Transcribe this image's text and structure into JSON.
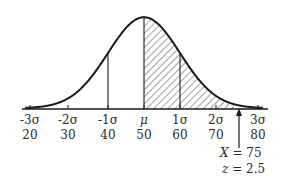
{
  "chart_data": {
    "type": "area",
    "title": "",
    "mean": 50,
    "sd": 10,
    "xlabel": "",
    "ylabel": "",
    "xlim": [
      17,
      83
    ],
    "grid": false,
    "legend": null,
    "sigma_ticks": [
      {
        "sigma_label": "-3σ",
        "value": "20",
        "x": 20
      },
      {
        "sigma_label": "-2σ",
        "value": "30",
        "x": 30
      },
      {
        "sigma_label": "-1σ",
        "value": "40",
        "x": 40
      },
      {
        "sigma_label": "μ",
        "value": "50",
        "x": 50
      },
      {
        "sigma_label": "1σ",
        "value": "60",
        "x": 60
      },
      {
        "sigma_label": "2σ",
        "value": "70",
        "x": 70
      },
      {
        "sigma_label": "3σ",
        "value": "80",
        "x": 80
      }
    ],
    "vertical_lines_at": [
      40,
      50,
      60
    ],
    "shaded_region": {
      "from": 50,
      "to": 75,
      "pattern": "diagonal-hatch"
    },
    "annotation": {
      "x_label": "X",
      "x_value": "75",
      "z_label": "z",
      "z_value": "2.5",
      "arrow_at": 75
    }
  },
  "labels": {
    "ticks": [
      {
        "sigma": "-3σ",
        "val": "20"
      },
      {
        "sigma": "-2σ",
        "val": "30"
      },
      {
        "sigma": "-1σ",
        "val": "40"
      },
      {
        "sigma": "μ",
        "val": "50"
      },
      {
        "sigma": "1σ",
        "val": "60"
      },
      {
        "sigma": "2σ",
        "val": "70"
      },
      {
        "sigma": "3σ",
        "val": "80"
      }
    ],
    "x_text": "X",
    "x_eq": "= 75",
    "z_text": "z",
    "z_eq": "= 2.5"
  }
}
